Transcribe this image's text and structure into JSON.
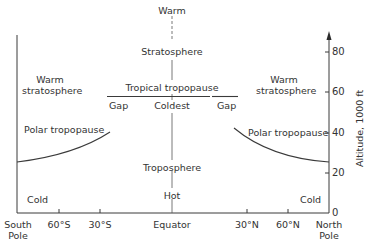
{
  "diagram": {
    "type": "atmospheric cross-section",
    "center_labels": {
      "top": "Warm",
      "stratosphere": "Stratosphere",
      "tropical_tropopause": "Tropical tropopause",
      "coldest": "Coldest",
      "troposphere": "Troposphere",
      "hot": "Hot"
    },
    "left_labels": {
      "warm_strat_line1": "Warm",
      "warm_strat_line2": "stratosphere",
      "polar_tropopause": "Polar tropopause",
      "cold": "Cold",
      "gap": "Gap"
    },
    "right_labels": {
      "warm_strat_line1": "Warm",
      "warm_strat_line2": "stratosphere",
      "polar_tropopause": "Polar tropopause",
      "cold": "Cold",
      "gap": "Gap"
    },
    "y_axis": {
      "title": "Altitude,  1000  ft",
      "ticks": [
        "0",
        "20",
        "40",
        "60",
        "80"
      ]
    },
    "x_axis": {
      "south_pole_line1": "South",
      "south_pole_line2": "Pole",
      "s60": "60°S",
      "s30": "30°S",
      "equator": "Equator",
      "n30": "30°N",
      "n60": "60°N",
      "north_pole_line1": "North",
      "north_pole_line2": "Pole"
    },
    "colors": {
      "line": "#3a3a3a",
      "text": "#333333",
      "background": "#ffffff"
    }
  }
}
